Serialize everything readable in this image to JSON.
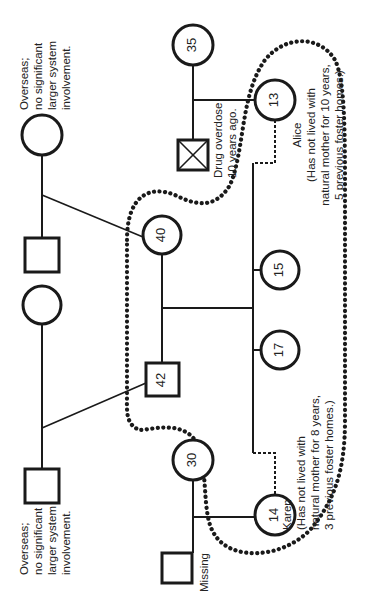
{
  "diagram": {
    "type": "genogram",
    "orientation": "rotated-90-ccw",
    "colors": {
      "line": "#1a1a1a",
      "boundary": "#1a1a1a",
      "text": "#222222",
      "background": "#ffffff"
    }
  },
  "people": {
    "p35": {
      "age": "35",
      "sex": "female"
    },
    "deceased_male": {
      "sex": "male",
      "deceased": true,
      "note": [
        "Drug overdose",
        "10 years  ago."
      ]
    },
    "alice": {
      "age": "13",
      "sex": "female",
      "name": "Alice",
      "note": [
        "(Has not lived with",
        "natural mother for 10 years,",
        "5 previous foster homes.)"
      ]
    },
    "p40": {
      "age": "40",
      "sex": "female"
    },
    "p42": {
      "age": "42",
      "sex": "male"
    },
    "p15": {
      "age": "15",
      "sex": "female"
    },
    "p17": {
      "age": "17",
      "sex": "female"
    },
    "p30": {
      "age": "30",
      "sex": "female"
    },
    "karen": {
      "age": "14",
      "sex": "female",
      "name": "Karen",
      "note": [
        "(Has not lived with",
        "natural mother for 8 years,",
        "3 previous foster homes.)"
      ]
    },
    "missing_male": {
      "sex": "male",
      "note": "Missing"
    },
    "gp_top_female": {
      "sex": "female",
      "note": [
        "Overseas;",
        "no significant",
        "larger system",
        "involvement."
      ]
    },
    "gp_top_male": {
      "sex": "male"
    },
    "gp_bottom_female": {
      "sex": "female"
    },
    "gp_bottom_male": {
      "sex": "male",
      "note": [
        "Overseas;",
        "no significant",
        "larger system",
        "involvement."
      ]
    }
  }
}
